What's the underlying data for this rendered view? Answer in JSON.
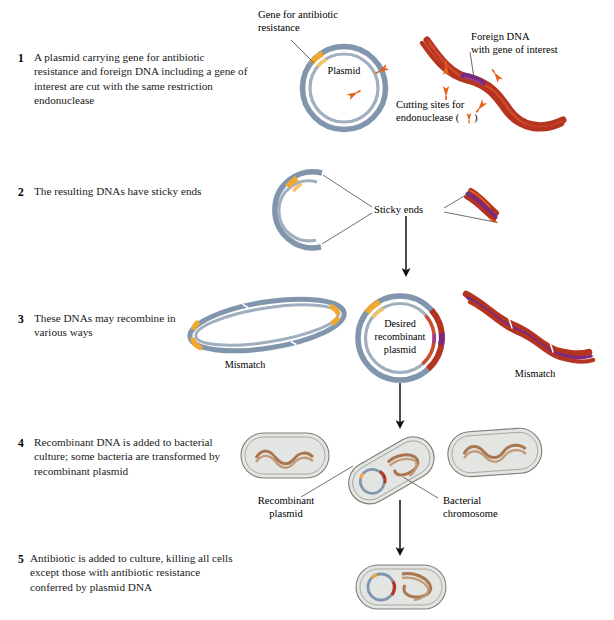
{
  "figure": {
    "background": "#ffffff"
  },
  "colors": {
    "plasmid_blue": "#8195ac",
    "plasmid_blue_light": "#aebcc9",
    "gene_orange": "#f0a830",
    "gene_orange_dark": "#d98b13",
    "foreign_dna_red": "#b5341f",
    "foreign_dna_red_light": "#cf4a2a",
    "gene_purple": "#7b2a7e",
    "arrow_orange": "#e8601c",
    "cell_fill": "#e2e5e1",
    "cell_outline": "#7d7f74",
    "chromosome_brown": "#a9764f",
    "text_black": "#1a1a1a",
    "leader_line": "#555555"
  },
  "steps": [
    {
      "number": "1",
      "text": "A plasmid carrying gene for antibiotic resistance and foreign DNA including a gene of interest are cut with the same restriction endonuclease"
    },
    {
      "number": "2",
      "text": "The resulting DNAs have sticky ends"
    },
    {
      "number": "3",
      "text": "These DNAs may recombine in various ways"
    },
    {
      "number": "4",
      "text": "Recombinant DNA is added to bacterial culture; some bacteria are transformed by recombinant plasmid"
    },
    {
      "number": "5",
      "text": "Antibiotic is added to culture, killing all cells except those with antibiotic resistance conferred by plasmid DNA"
    }
  ],
  "labels": {
    "gene_for_antibiotic_resistance_line1": "Gene for antibiotic",
    "gene_for_antibiotic_resistance_line2": "resistance",
    "plasmid": "Plasmid",
    "foreign_dna_line1": "Foreign DNA",
    "foreign_dna_line2": "with gene of interest",
    "cutting_sites_line1": "Cutting sites for",
    "cutting_sites_line2": "endonuclease (",
    "cutting_sites_line2_end": ")",
    "sticky_ends": "Sticky ends",
    "mismatch_left": "Mismatch",
    "mismatch_right": "Mismatch",
    "desired_plasmid_line1": "Desired",
    "desired_plasmid_line2": "recombinant",
    "desired_plasmid_line3": "plasmid",
    "recombinant_plasmid_line1": "Recombinant",
    "recombinant_plasmid_line2": "plasmid",
    "bacterial_chromosome_line1": "Bacterial",
    "bacterial_chromosome_line2": "chromosome"
  },
  "footer": {
    "caption": ""
  }
}
